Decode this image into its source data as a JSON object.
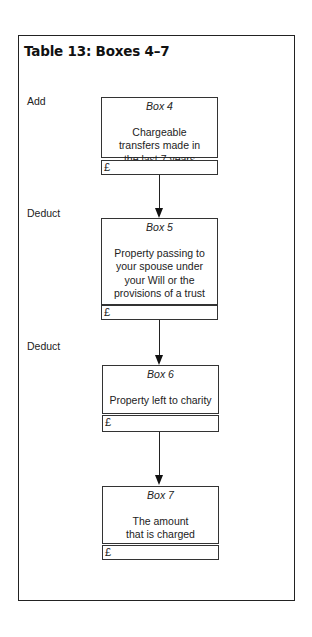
{
  "title": "Table 13:  Boxes 4–7",
  "operations": [
    "Add",
    "Deduct",
    "Deduct"
  ],
  "boxes": [
    {
      "name": "Box 4",
      "description": "Chargeable transfers made in the last 7 years",
      "currency": "£",
      "amount": ""
    },
    {
      "name": "Box 5",
      "description": "Property passing to your spouse under your Will or the provisions of a trust",
      "currency": "£",
      "amount": ""
    },
    {
      "name": "Box 6",
      "description": "Property left to charity",
      "currency": "£",
      "amount": ""
    },
    {
      "name": "Box 7",
      "description": "The amount that is charged",
      "currency": "£",
      "amount": ""
    }
  ]
}
